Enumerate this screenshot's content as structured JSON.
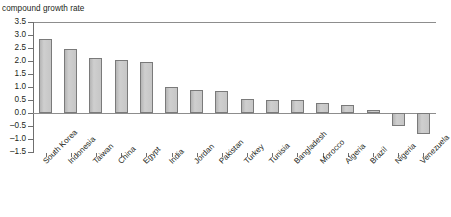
{
  "chart_data": {
    "type": "bar",
    "title": "compound growth rate of physical capital",
    "ylabel": "compound growth rate",
    "xlabel": "",
    "ylim": [
      -1.5,
      3.5
    ],
    "ytick_labels": [
      "3.5",
      "3.0",
      "2.5",
      "2.0",
      "1.5",
      "1.0",
      "0.5",
      "0.0",
      "-0.5",
      "-1.0",
      "-1.5"
    ],
    "ytick_values": [
      3.5,
      3.0,
      2.5,
      2.0,
      1.5,
      1.0,
      0.5,
      0.0,
      -0.5,
      -1.0,
      -1.5
    ],
    "grid": false,
    "legend": false,
    "bar_color": "#c3c3c3",
    "bar_edge_color": "#7a7a7a",
    "categories": [
      "South Korea",
      "Indonesia",
      "Taiwan",
      "China",
      "Egypt",
      "India",
      "Jordan",
      "Pakistan",
      "Turkey",
      "Tunisia",
      "Bangladesh",
      "Morocco",
      "Algeria",
      "Brazil",
      "Nigeria",
      "Venezuela"
    ],
    "values": [
      2.85,
      2.45,
      2.1,
      2.05,
      1.95,
      1.0,
      0.9,
      0.85,
      0.55,
      0.5,
      0.5,
      0.4,
      0.3,
      0.1,
      -0.5,
      -0.8
    ]
  }
}
